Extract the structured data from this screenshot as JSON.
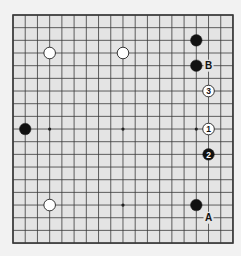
{
  "board": {
    "size": 19,
    "origin_x": 13,
    "origin_y": 15,
    "step_x": 12.22,
    "step_y": 12.67,
    "background": "#e4e4e4",
    "line_color": "#3a3a3a",
    "star_points": [
      [
        3,
        9
      ],
      [
        9,
        9
      ],
      [
        15,
        9
      ],
      [
        9,
        15
      ]
    ],
    "stones": [
      {
        "color": "black",
        "col": 15,
        "row": 2,
        "label": ""
      },
      {
        "color": "black",
        "col": 15,
        "row": 4,
        "label": ""
      },
      {
        "color": "white",
        "col": 3,
        "row": 3,
        "label": ""
      },
      {
        "color": "white",
        "col": 9,
        "row": 3,
        "label": ""
      },
      {
        "color": "white",
        "col": 16,
        "row": 6,
        "label": "3"
      },
      {
        "color": "black",
        "col": 1,
        "row": 9,
        "label": ""
      },
      {
        "color": "white",
        "col": 16,
        "row": 9,
        "label": "1"
      },
      {
        "color": "black",
        "col": 16,
        "row": 11,
        "label": "2"
      },
      {
        "color": "white",
        "col": 3,
        "row": 15,
        "label": ""
      },
      {
        "color": "black",
        "col": 15,
        "row": 15,
        "label": ""
      }
    ],
    "markers": [
      {
        "label": "B",
        "col": 16,
        "row": 4
      },
      {
        "label": "A",
        "col": 16,
        "row": 16
      }
    ]
  }
}
